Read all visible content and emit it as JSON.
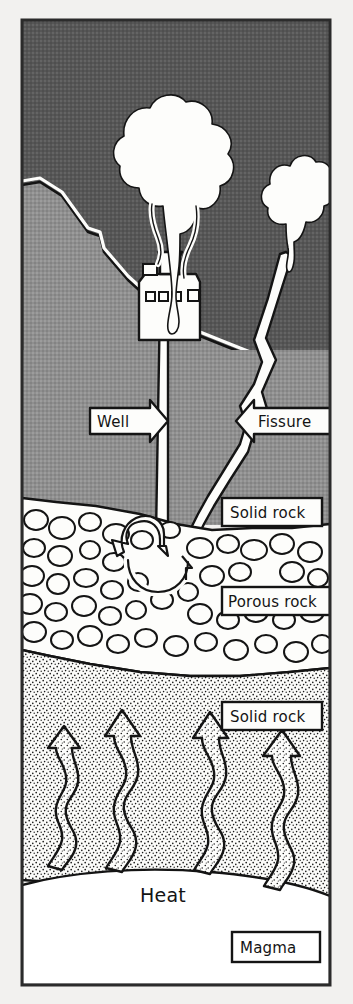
{
  "figure": {
    "frame": {
      "border_color": "#2b2b2b"
    }
  },
  "palette": {
    "paper": "#f2f1ef",
    "sky": "#5a5a5a",
    "bedrock_grey": "#8f8f8f",
    "steam_white": "#fdfdfb",
    "ink": "#141414",
    "stipple": "#fbfbf9",
    "magma_white": "#ffffff"
  },
  "labels": {
    "well": {
      "text": "Well",
      "style": "arrow-right-box"
    },
    "fissure": {
      "text": "Fissure",
      "style": "arrow-left-box"
    },
    "solid_rock_upper": {
      "text": "Solid rock",
      "style": "plain-box"
    },
    "porous_rock": {
      "text": "Porous rock",
      "style": "plain-box"
    },
    "solid_rock_lower": {
      "text": "Solid rock",
      "style": "plain-box"
    },
    "heat": {
      "text": "Heat",
      "style": "no-box"
    },
    "magma": {
      "text": "Magma",
      "style": "plain-box"
    }
  },
  "layers": [
    {
      "name": "sky",
      "description": "dark grey night sky"
    },
    {
      "name": "hillside",
      "description": "grey hill silhouette descending left to right"
    },
    {
      "name": "solid-rock-upper",
      "description": "mid-grey bedrock band"
    },
    {
      "name": "porous-rock",
      "description": "cobble / broken rock band"
    },
    {
      "name": "solid-rock-lower",
      "description": "stippled solid rock"
    },
    {
      "name": "magma",
      "description": "white magma body at base"
    }
  ],
  "elements": {
    "power_plant": {
      "name": "geothermal power plant",
      "windows": 4,
      "stack": 1
    },
    "steam_plume_main": {
      "name": "steam plume from well",
      "tendrils": 3
    },
    "steam_plume_fissure": {
      "name": "steam plume from fissure",
      "tendrils": 1
    },
    "well_shaft": {
      "name": "vertical well bore"
    },
    "fissure_channel": {
      "name": "zig-zag natural fissure"
    },
    "circulation_arrows": {
      "name": "water circulation in porous rock",
      "count": 3
    },
    "heat_arrows": {
      "name": "rising heat arrows",
      "count": 4
    }
  }
}
